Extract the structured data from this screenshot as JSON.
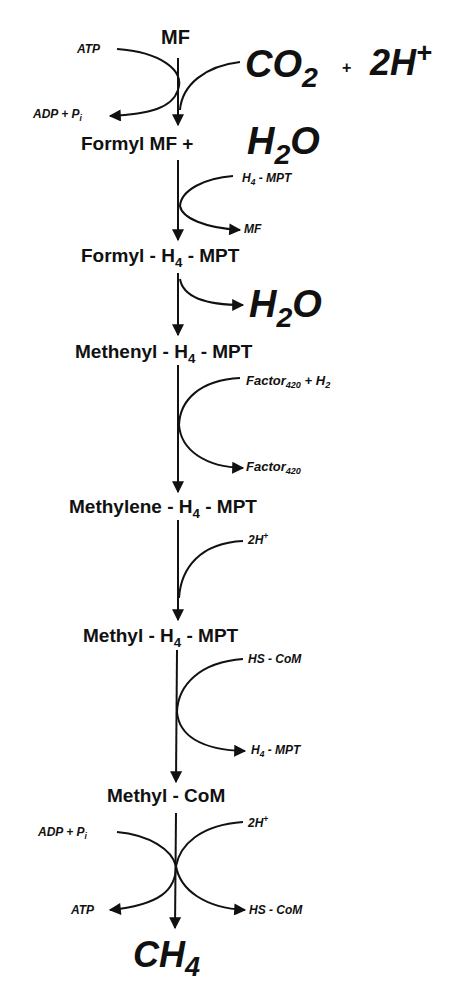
{
  "diagram": {
    "line_color": "#111111",
    "background": "#ffffff",
    "intermediates": [
      {
        "id": "mf",
        "text": "MF"
      },
      {
        "id": "formyl_mf",
        "text": "Formyl MF +"
      },
      {
        "id": "formyl_h4mpt",
        "pre": "Formyl - H",
        "sub": "4",
        "post": " - MPT"
      },
      {
        "id": "methenyl_h4mpt",
        "pre": "Methenyl - H",
        "sub": "4",
        "post": " - MPT"
      },
      {
        "id": "methylene_h4mpt",
        "pre": "Methylene - H",
        "sub": "4",
        "post": " - MPT"
      },
      {
        "id": "methyl_h4mpt",
        "pre": "Methyl - H",
        "sub": "4",
        "post": " - MPT"
      },
      {
        "id": "methyl_com",
        "text": "Methyl - CoM"
      },
      {
        "id": "ch4",
        "pre": "CH",
        "sub": "4"
      }
    ],
    "step1": {
      "atp_in": "ATP",
      "adp_out": {
        "pre": "ADP + P",
        "sub": "i"
      },
      "co2": {
        "pre": "CO",
        "sub": "2"
      },
      "plus": "+",
      "protons": {
        "pre": "2H",
        "sup": "+"
      },
      "water": {
        "pre": "H",
        "sub": "2",
        "post": "O"
      }
    },
    "step2": {
      "in": {
        "pre": "H",
        "sub": "4",
        "post": " - MPT"
      },
      "out": "MF"
    },
    "step3": {
      "out": {
        "pre": "H",
        "sub": "2",
        "post": "O"
      }
    },
    "step4": {
      "in": {
        "pre": "Factor",
        "sub": "420",
        "post": " + H",
        "sub2": "2"
      },
      "out": {
        "pre": "Factor",
        "sub": "420"
      }
    },
    "step5": {
      "in": {
        "pre": "2H",
        "sup": "+"
      }
    },
    "step6": {
      "in": "HS - CoM",
      "out": {
        "pre": "H",
        "sub": "4",
        "post": " - MPT"
      }
    },
    "step7": {
      "left_in": {
        "pre": "ADP + P",
        "sub": "i"
      },
      "left_out": "ATP",
      "right_in": {
        "pre": "2H",
        "sup": "+"
      },
      "right_out": "HS - CoM"
    }
  }
}
